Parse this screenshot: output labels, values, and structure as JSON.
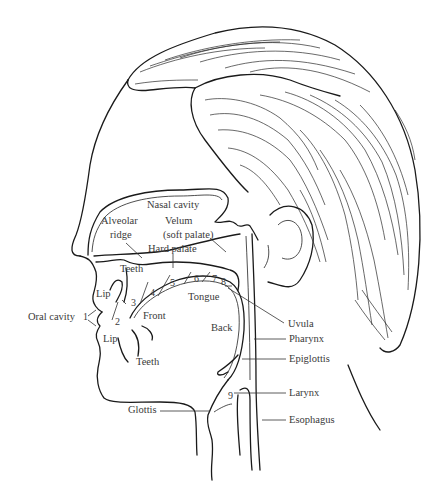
{
  "figure": {
    "labels": {
      "nasal_cavity": "Nasal cavity",
      "alveolar": "Alveolar",
      "ridge": "ridge",
      "velum": "Velum",
      "soft_palate": "(soft palate)",
      "hard_palate": "Hard palate",
      "teeth_upper": "Teeth",
      "lip_upper": "Lip",
      "oral_cavity": "Oral cavity",
      "front": "Front",
      "tongue": "Tongue",
      "back": "Back",
      "lip_lower": "Lip",
      "teeth_lower": "Teeth",
      "uvula": "Uvula",
      "pharynx": "Pharynx",
      "epiglottis": "Epiglottis",
      "larynx": "Larynx",
      "esophagus": "Esophagus",
      "glottis": "Glottis"
    },
    "place_numbers": [
      "1",
      "2",
      "3",
      "4",
      "5",
      "6",
      "7",
      "8",
      "9"
    ],
    "colors": {
      "ink": "#1a1a1a",
      "label_text": "#3a3a3a",
      "background": "#ffffff"
    }
  }
}
